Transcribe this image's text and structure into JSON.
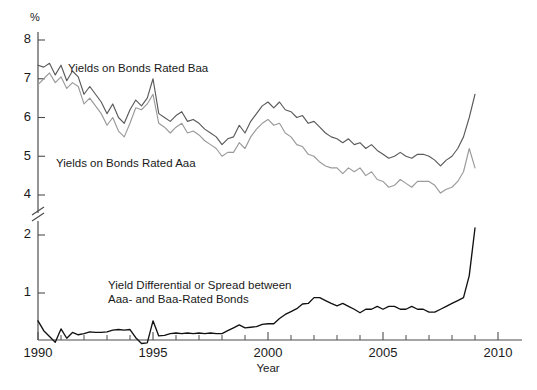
{
  "chart_data": {
    "type": "line",
    "title": "",
    "xlabel": "Year",
    "ylabel": "%",
    "unit_label": "%",
    "xlim": [
      1990,
      2010
    ],
    "xticks": [
      1990,
      1995,
      2000,
      2005,
      2010
    ],
    "xtick_labels": [
      "1990",
      "1995",
      "2000",
      "2005",
      "2010"
    ],
    "xtick_minor_step": 1,
    "yticks_upper": [
      8,
      7,
      6,
      5,
      4
    ],
    "yticks_lower": [
      2,
      1
    ],
    "ytick_labels_upper": [
      "8",
      "7",
      "6",
      "5",
      "4"
    ],
    "ytick_labels_lower": [
      "2",
      "1"
    ],
    "axis_break": true,
    "axis_break_between": [
      4,
      2
    ],
    "grid": false,
    "legend_position": "inline-annotations",
    "annotations": [
      {
        "id": "baa",
        "text": "Yields on Bonds Rated Baa",
        "x": 68,
        "y": 72
      },
      {
        "id": "aaa",
        "text": "Yields on Bonds Rated Aaa",
        "x": 56,
        "y": 167
      },
      {
        "id": "spread-line-1",
        "text": "Yield Differential or Spread between",
        "x": 108,
        "y": 289
      },
      {
        "id": "spread-line-2",
        "text": "Aaa- and Baa-Rated Bonds",
        "x": 108,
        "y": 303
      }
    ],
    "series": [
      {
        "name": "Yields on Bonds Rated Baa",
        "color": "#5a5a5a",
        "axis": "upper",
        "x": [
          1990.0,
          1990.25,
          1990.5,
          1990.75,
          1991.0,
          1991.25,
          1991.5,
          1991.75,
          1992.0,
          1992.25,
          1992.5,
          1992.75,
          1993.0,
          1993.25,
          1993.5,
          1993.75,
          1994.0,
          1994.25,
          1994.5,
          1994.75,
          1995.0,
          1995.25,
          1995.5,
          1995.75,
          1996.0,
          1996.25,
          1996.5,
          1996.75,
          1997.0,
          1997.25,
          1997.5,
          1997.75,
          1998.0,
          1998.25,
          1998.5,
          1998.75,
          1999.0,
          1999.25,
          1999.5,
          1999.75,
          2000.0,
          2000.25,
          2000.5,
          2000.75,
          2001.0,
          2001.25,
          2001.5,
          2001.75,
          2002.0,
          2002.25,
          2002.5,
          2002.75,
          2003.0,
          2003.25,
          2003.5,
          2003.75,
          2004.0,
          2004.25,
          2004.5,
          2004.75,
          2005.0,
          2005.25,
          2005.5,
          2005.75,
          2006.0,
          2006.25,
          2006.5,
          2006.75,
          2007.0,
          2007.25,
          2007.5,
          2007.75,
          2008.0,
          2008.25,
          2008.5,
          2008.75,
          2009.0
        ],
        "values": [
          7.35,
          7.3,
          7.4,
          7.1,
          7.35,
          6.95,
          7.2,
          7.05,
          6.6,
          6.8,
          6.6,
          6.4,
          6.1,
          6.35,
          6.0,
          5.85,
          6.2,
          6.45,
          6.3,
          6.5,
          7.0,
          6.1,
          6.0,
          5.9,
          6.05,
          6.15,
          5.9,
          5.95,
          5.85,
          5.7,
          5.6,
          5.5,
          5.3,
          5.45,
          5.5,
          5.8,
          5.6,
          5.9,
          6.1,
          6.3,
          6.4,
          6.25,
          6.4,
          6.2,
          6.15,
          6.0,
          6.05,
          5.85,
          5.9,
          5.75,
          5.6,
          5.5,
          5.45,
          5.35,
          5.45,
          5.3,
          5.35,
          5.2,
          5.3,
          5.15,
          5.05,
          4.95,
          5.0,
          5.1,
          5.0,
          4.95,
          5.05,
          5.05,
          5.0,
          4.9,
          4.75,
          4.9,
          5.0,
          5.2,
          5.5,
          6.0,
          6.6
        ]
      },
      {
        "name": "Yields on Bonds Rated Aaa",
        "color": "#9a9a9a",
        "axis": "upper",
        "x": [
          1990.0,
          1990.25,
          1990.5,
          1990.75,
          1991.0,
          1991.25,
          1991.5,
          1991.75,
          1992.0,
          1992.25,
          1992.5,
          1992.75,
          1993.0,
          1993.25,
          1993.5,
          1993.75,
          1994.0,
          1994.25,
          1994.5,
          1994.75,
          1995.0,
          1995.25,
          1995.5,
          1995.75,
          1996.0,
          1996.25,
          1996.5,
          1996.75,
          1997.0,
          1997.25,
          1997.5,
          1997.75,
          1998.0,
          1998.25,
          1998.5,
          1998.75,
          1999.0,
          1999.25,
          1999.5,
          1999.75,
          2000.0,
          2000.25,
          2000.5,
          2000.75,
          2001.0,
          2001.25,
          2001.5,
          2001.75,
          2002.0,
          2002.25,
          2002.5,
          2002.75,
          2003.0,
          2003.25,
          2003.5,
          2003.75,
          2004.0,
          2004.25,
          2004.5,
          2004.75,
          2005.0,
          2005.25,
          2005.5,
          2005.75,
          2006.0,
          2006.25,
          2006.5,
          2006.75,
          2007.0,
          2007.25,
          2007.5,
          2007.75,
          2008.0,
          2008.25,
          2008.5,
          2008.75,
          2009.0
        ],
        "values": [
          6.85,
          7.0,
          7.15,
          6.9,
          7.05,
          6.75,
          6.9,
          6.8,
          6.35,
          6.5,
          6.3,
          6.1,
          5.8,
          6.0,
          5.65,
          5.5,
          5.85,
          6.25,
          6.2,
          6.35,
          6.6,
          5.85,
          5.75,
          5.6,
          5.75,
          5.85,
          5.6,
          5.65,
          5.55,
          5.4,
          5.3,
          5.2,
          5.0,
          5.1,
          5.1,
          5.35,
          5.2,
          5.5,
          5.7,
          5.85,
          5.95,
          5.8,
          5.85,
          5.6,
          5.5,
          5.3,
          5.25,
          5.05,
          5.0,
          4.85,
          4.75,
          4.7,
          4.7,
          4.55,
          4.7,
          4.6,
          4.7,
          4.5,
          4.6,
          4.4,
          4.35,
          4.2,
          4.25,
          4.4,
          4.3,
          4.2,
          4.35,
          4.35,
          4.35,
          4.25,
          4.05,
          4.15,
          4.2,
          4.35,
          4.6,
          5.2,
          4.7
        ]
      },
      {
        "name": "Yield Differential or Spread between Aaa- and Baa-Rated Bonds",
        "color": "#111111",
        "axis": "lower",
        "x": [
          1990.0,
          1990.25,
          1990.5,
          1990.75,
          1991.0,
          1991.25,
          1991.5,
          1991.75,
          1992.0,
          1992.25,
          1992.5,
          1992.75,
          1993.0,
          1993.25,
          1993.5,
          1993.75,
          1994.0,
          1994.25,
          1994.5,
          1994.75,
          1995.0,
          1995.25,
          1995.5,
          1995.75,
          1996.0,
          1996.25,
          1996.5,
          1996.75,
          1997.0,
          1997.25,
          1997.5,
          1997.75,
          1998.0,
          1998.25,
          1998.5,
          1998.75,
          1999.0,
          1999.25,
          1999.5,
          1999.75,
          2000.0,
          2000.25,
          2000.5,
          2000.75,
          2001.0,
          2001.25,
          2001.5,
          2001.75,
          2002.0,
          2002.25,
          2002.5,
          2002.75,
          2003.0,
          2003.25,
          2003.5,
          2003.75,
          2004.0,
          2004.25,
          2004.5,
          2004.75,
          2005.0,
          2005.25,
          2005.5,
          2005.75,
          2006.0,
          2006.25,
          2006.5,
          2006.75,
          2007.0,
          2007.25,
          2007.5,
          2007.75,
          2008.0,
          2008.25,
          2008.5,
          2008.75,
          2009.0
        ],
        "values": [
          0.52,
          0.35,
          0.25,
          0.15,
          0.38,
          0.22,
          0.32,
          0.28,
          0.3,
          0.33,
          0.32,
          0.32,
          0.33,
          0.36,
          0.37,
          0.36,
          0.37,
          0.23,
          0.13,
          0.14,
          0.52,
          0.26,
          0.27,
          0.3,
          0.31,
          0.3,
          0.31,
          0.3,
          0.31,
          0.3,
          0.31,
          0.3,
          0.3,
          0.35,
          0.4,
          0.45,
          0.4,
          0.41,
          0.42,
          0.46,
          0.47,
          0.47,
          0.56,
          0.63,
          0.68,
          0.73,
          0.81,
          0.82,
          0.92,
          0.92,
          0.87,
          0.82,
          0.78,
          0.82,
          0.77,
          0.72,
          0.66,
          0.72,
          0.72,
          0.77,
          0.72,
          0.77,
          0.77,
          0.72,
          0.72,
          0.77,
          0.72,
          0.72,
          0.67,
          0.67,
          0.72,
          0.77,
          0.82,
          0.87,
          0.92,
          1.3,
          2.12
        ]
      }
    ]
  }
}
